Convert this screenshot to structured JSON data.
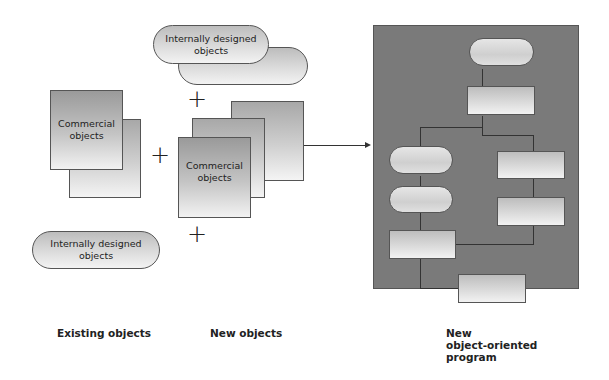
{
  "diagram": {
    "existing": {
      "caption": "Existing objects",
      "commercial_label_1": "Commercial",
      "commercial_label_2": "objects",
      "internal_label_1": "Internally designed",
      "internal_label_2": "objects"
    },
    "new": {
      "caption": "New objects",
      "internal_label_1": "Internally designed",
      "internal_label_2": "objects",
      "commercial_label_1": "Commercial",
      "commercial_label_2": "objects"
    },
    "program": {
      "caption_1": "New",
      "caption_2": "object-oriented",
      "caption_3": "program"
    },
    "operators": {
      "plus": "+"
    },
    "colors": {
      "panel": "#7a7a7a",
      "line": "#333333",
      "border": "#555555"
    }
  }
}
